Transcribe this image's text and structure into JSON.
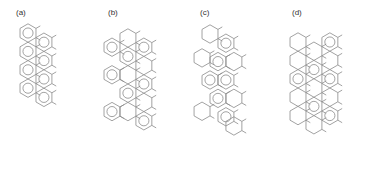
{
  "figure": {
    "panels": [
      {
        "label": "(a)",
        "structure": "zigzag-ribbon",
        "rings": [
          [
            0,
            0,
            true
          ],
          [
            1,
            0.5,
            true
          ],
          [
            0,
            1,
            true
          ],
          [
            1,
            1.5,
            true
          ],
          [
            0,
            2,
            true
          ],
          [
            1,
            2.5,
            true
          ],
          [
            0,
            3,
            true
          ],
          [
            1,
            3.5,
            true
          ]
        ]
      },
      {
        "label": "(b)",
        "structure": "armchair-ribbon",
        "rings": [
          [
            0,
            0.5,
            true
          ],
          [
            1,
            0,
            false
          ],
          [
            2,
            0.5,
            true
          ],
          [
            1,
            1,
            true
          ],
          [
            2,
            1.5,
            false
          ],
          [
            0,
            2,
            true
          ],
          [
            1,
            2,
            false
          ],
          [
            2,
            2.5,
            true
          ],
          [
            1,
            3,
            true
          ],
          [
            2,
            3.5,
            false
          ],
          [
            0,
            4,
            true
          ],
          [
            1,
            4,
            false
          ],
          [
            2,
            4.5,
            true
          ]
        ]
      },
      {
        "label": "(c)",
        "structure": "chiral-ribbon",
        "rings": [
          [
            0,
            0,
            false
          ],
          [
            1,
            0.5,
            true
          ],
          [
            -0.5,
            1.3,
            false
          ],
          [
            0.5,
            1.5,
            true
          ],
          [
            1.5,
            1.5,
            false
          ],
          [
            0,
            2.5,
            true
          ],
          [
            1,
            2.5,
            true
          ],
          [
            1.5,
            3.5,
            false
          ],
          [
            0.5,
            3.5,
            true
          ],
          [
            -0.5,
            4.2,
            false
          ],
          [
            1,
            4.5,
            true
          ],
          [
            1.5,
            5,
            false
          ]
        ]
      },
      {
        "label": "(d)",
        "structure": "wide-ribbon",
        "rings": [
          [
            0,
            0,
            false
          ],
          [
            1,
            0.5,
            false
          ],
          [
            2,
            0,
            true
          ],
          [
            0,
            1,
            false
          ],
          [
            1,
            1.5,
            true
          ],
          [
            2,
            1,
            false
          ],
          [
            0,
            2,
            true
          ],
          [
            1,
            2.5,
            false
          ],
          [
            2,
            2,
            true
          ],
          [
            0,
            3,
            false
          ],
          [
            1,
            3.5,
            true
          ],
          [
            2,
            3,
            false
          ],
          [
            0,
            4,
            false
          ],
          [
            1,
            4.5,
            false
          ],
          [
            2,
            4,
            true
          ]
        ]
      }
    ],
    "stroke_color": "#8a8a8a",
    "label_color": "#333333",
    "background": "#ffffff"
  }
}
